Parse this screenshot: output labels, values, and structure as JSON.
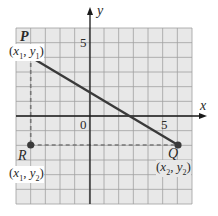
{
  "diagram": {
    "type": "coordinate-plane",
    "x_range": [
      -5,
      7
    ],
    "y_range": [
      -6,
      6
    ],
    "grid_step": 1,
    "axes": {
      "x_label": "x",
      "y_label": "y"
    },
    "tick_labels": {
      "x_5": "5",
      "y_5": "5",
      "origin": "0"
    },
    "points": [
      {
        "name": "P",
        "x": -4,
        "y": 4,
        "coord_label": "(x1, y1)"
      },
      {
        "name": "Q",
        "x": 6,
        "y": -2,
        "coord_label": "(x2, y2)"
      },
      {
        "name": "R",
        "x": -4,
        "y": -2,
        "coord_label": "(x1, y2)"
      }
    ],
    "segments": [
      {
        "from": "P",
        "to": "Q",
        "style": "solid"
      },
      {
        "from": "P",
        "to": "R",
        "style": "dashed"
      },
      {
        "from": "R",
        "to": "Q",
        "style": "dashed"
      }
    ],
    "colors": {
      "grid_bg": "#e8e8e8",
      "grid_line": "#9a9a9a",
      "axis": "#1a1a1a",
      "segment": "#3a3a3a",
      "point": "#3a3a3a",
      "dashed": "#777777"
    }
  },
  "labels": {
    "x_axis": "x",
    "y_axis": "y",
    "tick_x5": "5",
    "tick_y5": "5",
    "origin": "0",
    "P": "P",
    "Q": "Q",
    "R": "R",
    "P_coord": {
      "open": "(",
      "x": "x",
      "xs": "1",
      "sep": ", ",
      "y": "y",
      "ys": "1",
      "close": ")"
    },
    "Q_coord": {
      "open": "(",
      "x": "x",
      "xs": "2",
      "sep": ", ",
      "y": "y",
      "ys": "2",
      "close": ")"
    },
    "R_coord": {
      "open": "(",
      "x": "x",
      "xs": "1",
      "sep": ", ",
      "y": "y",
      "ys": "2",
      "close": ")"
    }
  }
}
